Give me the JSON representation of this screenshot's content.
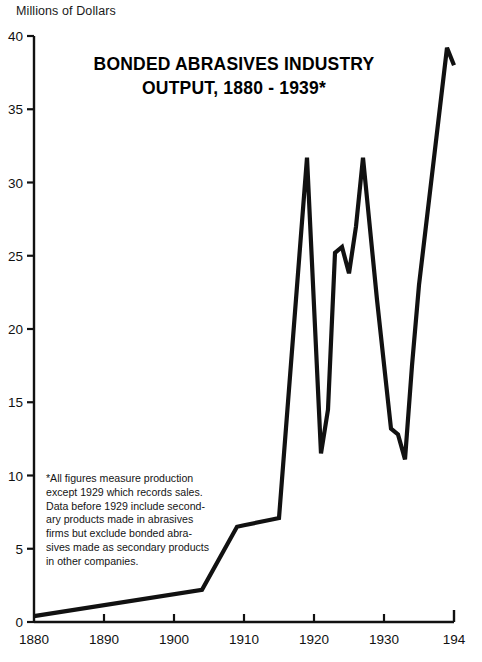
{
  "axis_label_top": "Millions of Dollars",
  "title": {
    "line1": "BONDED ABRASIVES INDUSTRY",
    "line2": "OUTPUT, 1880 - 1939*"
  },
  "footnote": {
    "line1": "*All figures measure production",
    "line2": "except 1929 which records sales.",
    "line3": "Data before 1929 include second-",
    "line4": "ary products made in abrasives",
    "line5": "firms but exclude bonded abra-",
    "line6": "sives made as secondary products",
    "line7": "in other companies."
  },
  "colors": {
    "line": "#111111",
    "axis": "#111111",
    "background": "#ffffff",
    "text": "#111111"
  },
  "chart_data": {
    "type": "line",
    "title": "BONDED ABRASIVES INDUSTRY OUTPUT, 1880 - 1939*",
    "xlabel": "",
    "ylabel": "Millions of Dollars",
    "xlim": [
      1880,
      1940
    ],
    "ylim": [
      0,
      40
    ],
    "grid": false,
    "legend": null,
    "xticks": [
      1880,
      1890,
      1900,
      1910,
      1920,
      1930,
      1940
    ],
    "xtick_labels": [
      "1880",
      "1890",
      "1900",
      "1910",
      "1920",
      "1930",
      "194"
    ],
    "yticks": [
      0,
      5,
      10,
      15,
      20,
      25,
      30,
      35,
      40
    ],
    "ytick_labels": [
      "0",
      "5",
      "10",
      "15",
      "20",
      "25",
      "30",
      "35",
      "40"
    ],
    "x": [
      1880,
      1904,
      1909,
      1910,
      1914,
      1915,
      1919,
      1921,
      1922,
      1923,
      1924,
      1925,
      1926,
      1927,
      1929,
      1931,
      1932,
      1933,
      1934,
      1935,
      1939,
      1940
    ],
    "y": [
      0.4,
      2.2,
      6.5,
      6.6,
      7.0,
      7.1,
      31.7,
      11.5,
      14.5,
      25.2,
      25.6,
      23.8,
      27.0,
      31.7,
      22.0,
      13.2,
      12.8,
      11.1,
      17.5,
      23.0,
      39.2,
      38.0
    ],
    "series": [
      {
        "name": "Bonded abrasives industry output",
        "unit": "millions of dollars",
        "points": [
          {
            "year": 1880,
            "value": 0.4
          },
          {
            "year": 1904,
            "value": 2.2
          },
          {
            "year": 1909,
            "value": 6.5
          },
          {
            "year": 1910,
            "value": 6.6
          },
          {
            "year": 1914,
            "value": 7.0
          },
          {
            "year": 1915,
            "value": 7.1
          },
          {
            "year": 1919,
            "value": 31.7
          },
          {
            "year": 1921,
            "value": 11.5
          },
          {
            "year": 1922,
            "value": 14.5
          },
          {
            "year": 1923,
            "value": 25.2
          },
          {
            "year": 1924,
            "value": 25.6
          },
          {
            "year": 1925,
            "value": 23.8
          },
          {
            "year": 1926,
            "value": 27.0
          },
          {
            "year": 1927,
            "value": 31.7
          },
          {
            "year": 1929,
            "value": 22.0
          },
          {
            "year": 1931,
            "value": 13.2
          },
          {
            "year": 1932,
            "value": 12.8
          },
          {
            "year": 1933,
            "value": 11.1
          },
          {
            "year": 1934,
            "value": 17.5
          },
          {
            "year": 1935,
            "value": 23.0
          },
          {
            "year": 1939,
            "value": 39.2
          },
          {
            "year": 1940,
            "value": 38.0
          }
        ]
      }
    ]
  }
}
